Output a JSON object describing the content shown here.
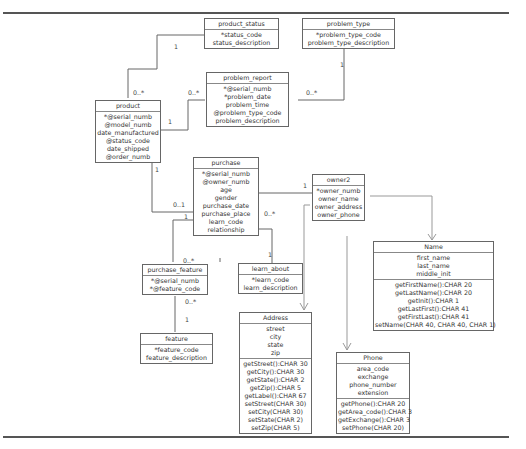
{
  "diagram": {
    "type": "entity-relationship / UML class diagram",
    "entities": [
      {
        "id": "product_status",
        "name": "product_status",
        "attributes": [
          "*status_code",
          "status_description"
        ],
        "methods": []
      },
      {
        "id": "problem_type",
        "name": "problem_type",
        "attributes": [
          "*problem_type_code",
          "problem_type_description"
        ],
        "methods": []
      },
      {
        "id": "problem_report",
        "name": "problem_report",
        "attributes": [
          "*@serial_numb",
          "*problem_date",
          "problem_time",
          "@problem_type_code",
          "problem_description"
        ],
        "methods": []
      },
      {
        "id": "product",
        "name": "product",
        "attributes": [
          "*@serial_numb",
          "@model_numb",
          "date_manufactured",
          "@status_code",
          "date_shipped",
          "@order_numb"
        ],
        "methods": []
      },
      {
        "id": "purchase",
        "name": "purchase",
        "attributes": [
          "*@serial_numb",
          "@owner_numb",
          "age",
          "gender",
          "purchase_date",
          "purchase_place",
          "learn_code",
          "relationship"
        ],
        "methods": []
      },
      {
        "id": "owner2",
        "name": "owner2",
        "attributes": [
          "*owner_numb",
          "owner_name",
          "owner_address",
          "owner_phone"
        ],
        "methods": []
      },
      {
        "id": "name",
        "name": "Name",
        "attributes": [
          "first_name",
          "last_name",
          "middle_init"
        ],
        "methods": [
          "getFirstName():CHAR 20",
          "getLastName():CHAR 20",
          "getInit():CHAR 1",
          "getLastFirst():CHAR 41",
          "getFirstLast():CHAR 41",
          "setName(CHAR 40, CHAR 40, CHAR 1)"
        ]
      },
      {
        "id": "purchase_feature",
        "name": "purchase_feature",
        "attributes": [
          "*@serial_numb",
          "*@feature_code"
        ],
        "methods": []
      },
      {
        "id": "learn_about",
        "name": "learn_about",
        "attributes": [
          "*learn_code",
          "learn_description"
        ],
        "methods": []
      },
      {
        "id": "feature",
        "name": "feature",
        "attributes": [
          "*feature_code",
          "feature_description"
        ],
        "methods": []
      },
      {
        "id": "address",
        "name": "Address",
        "attributes": [
          "street",
          "city",
          "state",
          "zip"
        ],
        "methods": [
          "getStreet():CHAR 30",
          "getCity():CHAR 30",
          "getState():CHAR 2",
          "getZip():CHAR 5",
          "getLabel():CHAR 67",
          "setStreet(CHAR 30)",
          "setCity(CHAR 30)",
          "setState(CHAR 2)",
          "setZip(CHAR 5)"
        ]
      },
      {
        "id": "phone",
        "name": "Phone",
        "attributes": [
          "area_code",
          "exchange",
          "phone_number",
          "extension"
        ],
        "methods": [
          "getPhone():CHAR 20",
          "getArea_code():CHAR 3",
          "getExchange():CHAR 3",
          "setPhone(CHAR 20)"
        ]
      }
    ],
    "relationships": [
      {
        "from": "product_status",
        "to": "product",
        "from_mult": "1",
        "to_mult": "0..*"
      },
      {
        "from": "product",
        "to": "problem_report",
        "from_mult": "1",
        "to_mult": "0..*"
      },
      {
        "from": "problem_type",
        "to": "problem_report",
        "from_mult": "1",
        "to_mult": "0..*"
      },
      {
        "from": "product",
        "to": "purchase",
        "from_mult": "1",
        "to_mult": "0..1"
      },
      {
        "from": "owner2",
        "to": "purchase",
        "from_mult": "1",
        "to_mult": "0..*"
      },
      {
        "from": "purchase",
        "to": "purchase_feature",
        "from_mult": "1",
        "to_mult": "0..*"
      },
      {
        "from": "learn_about",
        "to": "purchase",
        "from_mult": "1",
        "to_mult": "0..*"
      },
      {
        "from": "feature",
        "to": "purchase_feature",
        "from_mult": "1",
        "to_mult": "0..*"
      },
      {
        "from": "owner2",
        "to": "name",
        "type": "dependency"
      },
      {
        "from": "owner2",
        "to": "address",
        "type": "dependency"
      },
      {
        "from": "owner2",
        "to": "phone",
        "type": "dependency"
      }
    ]
  },
  "boxes": {
    "product_status": {
      "title": "product_status",
      "a0": "*status_code",
      "a1": "status_description"
    },
    "problem_type": {
      "title": "problem_type",
      "a0": "*problem_type_code",
      "a1": "problem_type_description"
    },
    "problem_report": {
      "title": "problem_report",
      "a0": "*@serial_numb",
      "a1": "*problem_date",
      "a2": "problem_time",
      "a3": "@problem_type_code",
      "a4": "problem_description"
    },
    "product": {
      "title": "product",
      "a0": "*@serial_numb",
      "a1": "@model_numb",
      "a2": "date_manufactured",
      "a3": "@status_code",
      "a4": "date_shipped",
      "a5": "@order_numb"
    },
    "purchase": {
      "title": "purchase",
      "a0": "*@serial_numb",
      "a1": "@owner_numb",
      "a2": "age",
      "a3": "gender",
      "a4": "purchase_date",
      "a5": "purchase_place",
      "a6": "learn_code",
      "a7": "relationship"
    },
    "owner2": {
      "title": "owner2",
      "a0": "*owner_numb",
      "a1": "owner_name",
      "a2": "owner_address",
      "a3": "owner_phone"
    },
    "name": {
      "title": "Name",
      "a0": "first_name",
      "a1": "last_name",
      "a2": "middle_init",
      "m0": "getFirstName():CHAR 20",
      "m1": "getLastName():CHAR 20",
      "m2": "getInit():CHAR 1",
      "m3": "getLastFirst():CHAR 41",
      "m4": "getFirstLast():CHAR 41",
      "m5": "setName(CHAR 40, CHAR 40, CHAR 1)"
    },
    "purchase_feature": {
      "title": "purchase_feature",
      "a0": "*@serial_numb",
      "a1": "*@feature_code"
    },
    "learn_about": {
      "title": "learn_about",
      "a0": "*learn_code",
      "a1": "learn_description"
    },
    "feature": {
      "title": "feature",
      "a0": "*feature_code",
      "a1": "feature_description"
    },
    "address": {
      "title": "Address",
      "a0": "street",
      "a1": "city",
      "a2": "state",
      "a3": "zip",
      "m0": "getStreet():CHAR 30",
      "m1": "getCity():CHAR 30",
      "m2": "getState():CHAR 2",
      "m3": "getZip():CHAR 5",
      "m4": "getLabel():CHAR 67",
      "m5": "setStreet(CHAR 30)",
      "m6": "setCity(CHAR 30)",
      "m7": "setState(CHAR 2)",
      "m8": "setZip(CHAR 5)"
    },
    "phone": {
      "title": "Phone",
      "a0": "area_code",
      "a1": "exchange",
      "a2": "phone_number",
      "a3": "extension",
      "m0": "getPhone():CHAR 20",
      "m1": "getArea_code():CHAR 3",
      "m2": "getExchange():CHAR 3",
      "m3": "setPhone(CHAR 20)"
    }
  },
  "multiplicities": {
    "ps_one": "1",
    "ps_many": "0..*",
    "prod_pr_one": "1",
    "prod_pr_many": "0..*",
    "pt_one": "1",
    "pt_many": "0..*",
    "prod_pur_one": "1",
    "prod_pur_zero_one": "0..1",
    "own_pur_one": "1",
    "own_pur_many": "0..*",
    "pur_pf_one": "1",
    "pur_pf_many": "0..*",
    "la_one": "1",
    "la_many": "0..*",
    "feat_one": "1",
    "feat_many": "0..*"
  },
  "colors": {
    "line": "#666666",
    "dependency": "#999999",
    "rule": "#555555"
  }
}
